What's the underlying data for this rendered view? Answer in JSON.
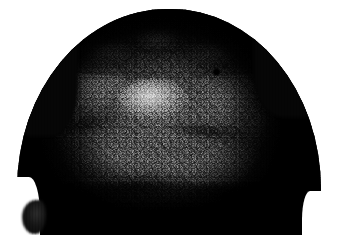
{
  "figure": {
    "kind": "clinical-photograph",
    "modality": "color-photograph-grayscale",
    "subject": "scalp",
    "view": "superior-frontal (vertex / forehead) view of head",
    "caption": "",
    "title": "",
    "label": "",
    "alt_text": "Grayscale close-up clinical photograph of the vertex and frontal scalp of a head, showing diffuse confluent papules and scaly plaques with a central specular highlight, framed by dark hair at the crown and temples.",
    "visible_text": []
  },
  "image_content": {
    "orientation": "landscape",
    "width_px": 338,
    "height_px": 243,
    "color_mode": "grayscale",
    "background_color": "#ffffff",
    "photo_bounds": {
      "left_px": 17,
      "top_px": 9,
      "right_px": 321,
      "bottom_px": 235
    },
    "head_outline": {
      "shape": "dome / rounded crown filling the frame",
      "crown_apex_y_px": 10,
      "left_widest_x_px": 19,
      "right_widest_x_px": 319
    },
    "regions": [
      {
        "name": "crown-hair-band",
        "position": "top arc of head, x 75-255, y 10-45",
        "tone": "very dark",
        "tone_hex": "#0a0a0a",
        "description": "dark curved band of short hair along the crown silhouette"
      },
      {
        "name": "temporal-hair-left",
        "position": "left margin of head, y 20-200",
        "tone": "near black",
        "tone_hex": "#050505",
        "description": "dark hair mass down the left temple"
      },
      {
        "name": "temporal-hair-right",
        "position": "right margin of head, y 15-210",
        "tone": "near black",
        "tone_hex": "#050505",
        "description": "dark hair mass down the right temple"
      },
      {
        "name": "central-scalp-highlight",
        "position": "center, x 140-185, y 85-118",
        "tone": "bright",
        "tone_hex": "#e8e8e8",
        "description": "specular highlight on the most prominent convexity of the scalp"
      },
      {
        "name": "scaly-plaques-upper",
        "position": "upper scalp below hairline, y 35-75",
        "tone": "mid-light mottled",
        "tone_hex": "#b4b4b4",
        "description": "irregular light grey scaly plaques and crusts near the hairline"
      },
      {
        "name": "papular-field-central",
        "position": "mid scalp, x 60-290, y 70-170",
        "tone": "mid grey, densely stippled",
        "tone_hex": "#787878",
        "description": "confluent field of fine papules giving a pebbled, cobblestone texture"
      },
      {
        "name": "shadowed-lower-scalp",
        "position": "lower scalp / forehead, y 165-235",
        "tone": "dark mottled",
        "tone_hex": "#2b2b2b",
        "description": "shadowed lower region with coarse nodular plaques and dark creases"
      },
      {
        "name": "punctate-dark-lesion",
        "position": "right of center, about x 218, y 70",
        "tone": "black",
        "tone_hex": "#000000",
        "description": "small dark punctate mark / crust"
      },
      {
        "name": "ear-protrusion-lower-left",
        "position": "bottom left, x 22-48, y 198-234",
        "tone": "very dark",
        "tone_hex": "#131313",
        "description": "dark protrusion at lower left (ear / hair tuft) against the white margin"
      }
    ],
    "tone_palette": {
      "paper_white": "#ffffff",
      "highlight": "#e8e8e8",
      "light_scale": "#c4c4c4",
      "mid_grey": "#787878",
      "dark_grey": "#3a3a3a",
      "shadow": "#1c1c1c",
      "black": "#000000"
    }
  }
}
